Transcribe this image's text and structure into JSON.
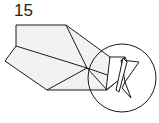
{
  "step": {
    "number": "15"
  },
  "diagram": {
    "colors": {
      "stroke": "#1a1a1a",
      "paper_fill": "#f2f2f2",
      "background": "#ffffff"
    }
  }
}
